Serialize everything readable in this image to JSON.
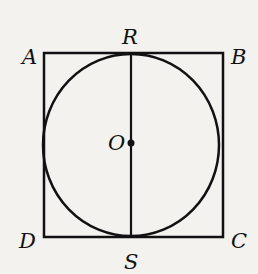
{
  "figure": {
    "labels": {
      "A": "A",
      "B": "B",
      "C": "C",
      "D": "D",
      "R": "R",
      "S": "S",
      "O": "O"
    },
    "colors": {
      "stroke": "#111111",
      "background": "#f3f2ef"
    }
  }
}
